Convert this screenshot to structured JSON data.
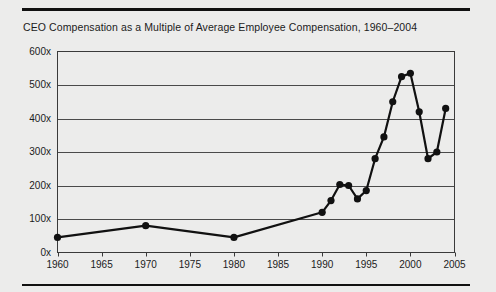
{
  "figure": {
    "title": "CEO Compensation as a Multiple of Average Employee Compensation, 1960–2004",
    "background_color": "#ececeb",
    "rule_color": "#111111"
  },
  "chart_data": {
    "type": "line",
    "title": "CEO Compensation as a Multiple of Average Employee Compensation, 1960–2004",
    "xlabel": "",
    "ylabel": "",
    "xlim": [
      1960,
      2005
    ],
    "ylim": [
      0,
      600
    ],
    "grid": true,
    "legend": null,
    "line_color": "#111111",
    "marker": "circle",
    "marker_color": "#111111",
    "x_tick_labels": [
      "1960",
      "1965",
      "1970",
      "1975",
      "1980",
      "1985",
      "1990",
      "1995",
      "2000",
      "2005"
    ],
    "x_ticks": [
      1960,
      1965,
      1970,
      1975,
      1980,
      1985,
      1990,
      1995,
      2000,
      2005
    ],
    "y_tick_labels": [
      "0x",
      "100x",
      "200x",
      "300x",
      "400x",
      "500x",
      "600x"
    ],
    "y_ticks": [
      0,
      100,
      200,
      300,
      400,
      500,
      600
    ],
    "series": [
      {
        "name": "CEO compensation multiple",
        "x": [
          1960,
          1970,
          1980,
          1990,
          1991,
          1992,
          1993,
          1994,
          1995,
          1996,
          1997,
          1998,
          1999,
          2000,
          2001,
          2002,
          2003,
          2004
        ],
        "values": [
          45,
          80,
          45,
          120,
          155,
          203,
          200,
          160,
          185,
          280,
          345,
          450,
          525,
          535,
          420,
          280,
          300,
          430
        ]
      }
    ]
  }
}
